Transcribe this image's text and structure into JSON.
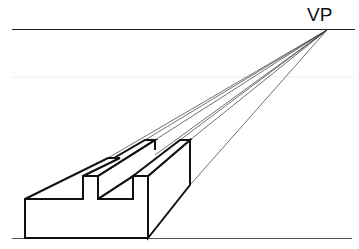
{
  "diagram": {
    "vanishing_point": {
      "label": "VP",
      "x": 327,
      "y": 30
    },
    "horizon_line": {
      "y": 30,
      "x1": 12,
      "x2": 355
    },
    "ground_line": {
      "y": 238,
      "x1": 12,
      "x2": 352
    },
    "colors": {
      "lines": "#111111",
      "construction": "#333333",
      "faint": "#e6e6e6",
      "background": "#ffffff"
    }
  }
}
